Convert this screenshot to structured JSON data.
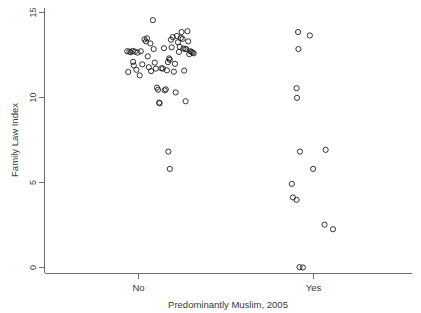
{
  "chart_data": {
    "type": "scatter",
    "title": "",
    "xlabel": "Predominantly Muslim, 2005",
    "ylabel": "Family Law Index",
    "categories": [
      "No",
      "Yes"
    ],
    "yticks": [
      0,
      5,
      10,
      15
    ],
    "ytick_labels": [
      "0",
      "5",
      "10",
      "15"
    ],
    "ylim": [
      -0.6,
      15.2
    ],
    "xlim": [
      0,
      1
    ],
    "grid": false,
    "legend": "none",
    "marker": "open-circle",
    "marker_color": "#1d1d1d",
    "axis_color": "#6e6e6e",
    "note": "Jittered categorical scatter; x positions are jitter offsets within each category band.",
    "series": [
      {
        "name": "No",
        "x_center": 0.295,
        "points": [
          {
            "x": 0.225,
            "y": 12.72
          },
          {
            "x": 0.231,
            "y": 12.7
          },
          {
            "x": 0.235,
            "y": 12.66
          },
          {
            "x": 0.24,
            "y": 12.74
          },
          {
            "x": 0.246,
            "y": 12.7
          },
          {
            "x": 0.253,
            "y": 12.64
          },
          {
            "x": 0.241,
            "y": 12.1
          },
          {
            "x": 0.243,
            "y": 11.88
          },
          {
            "x": 0.228,
            "y": 11.5
          },
          {
            "x": 0.25,
            "y": 11.63
          },
          {
            "x": 0.259,
            "y": 11.3
          },
          {
            "x": 0.262,
            "y": 12.72
          },
          {
            "x": 0.266,
            "y": 11.95
          },
          {
            "x": 0.272,
            "y": 13.42
          },
          {
            "x": 0.276,
            "y": 13.3
          },
          {
            "x": 0.279,
            "y": 13.48
          },
          {
            "x": 0.281,
            "y": 12.42
          },
          {
            "x": 0.284,
            "y": 11.78
          },
          {
            "x": 0.288,
            "y": 13.18
          },
          {
            "x": 0.29,
            "y": 11.55
          },
          {
            "x": 0.295,
            "y": 14.55
          },
          {
            "x": 0.297,
            "y": 12.85
          },
          {
            "x": 0.3,
            "y": 12.05
          },
          {
            "x": 0.303,
            "y": 11.7
          },
          {
            "x": 0.306,
            "y": 10.58
          },
          {
            "x": 0.309,
            "y": 10.46
          },
          {
            "x": 0.312,
            "y": 9.7
          },
          {
            "x": 0.313,
            "y": 9.66
          },
          {
            "x": 0.318,
            "y": 11.72
          },
          {
            "x": 0.322,
            "y": 11.7
          },
          {
            "x": 0.325,
            "y": 12.9
          },
          {
            "x": 0.327,
            "y": 10.42
          },
          {
            "x": 0.33,
            "y": 10.48
          },
          {
            "x": 0.333,
            "y": 11.6
          },
          {
            "x": 0.336,
            "y": 12.08
          },
          {
            "x": 0.339,
            "y": 12.3
          },
          {
            "x": 0.341,
            "y": 12.22
          },
          {
            "x": 0.344,
            "y": 13.4
          },
          {
            "x": 0.346,
            "y": 12.95
          },
          {
            "x": 0.349,
            "y": 13.55
          },
          {
            "x": 0.352,
            "y": 11.52
          },
          {
            "x": 0.355,
            "y": 11.98
          },
          {
            "x": 0.357,
            "y": 10.3
          },
          {
            "x": 0.36,
            "y": 13.62
          },
          {
            "x": 0.363,
            "y": 13.25
          },
          {
            "x": 0.366,
            "y": 12.68
          },
          {
            "x": 0.368,
            "y": 12.98
          },
          {
            "x": 0.371,
            "y": 13.5
          },
          {
            "x": 0.373,
            "y": 13.85
          },
          {
            "x": 0.376,
            "y": 13.45
          },
          {
            "x": 0.378,
            "y": 12.88
          },
          {
            "x": 0.38,
            "y": 11.58
          },
          {
            "x": 0.383,
            "y": 12.86
          },
          {
            "x": 0.386,
            "y": 12.84
          },
          {
            "x": 0.389,
            "y": 13.9
          },
          {
            "x": 0.391,
            "y": 13.3
          },
          {
            "x": 0.394,
            "y": 12.55
          },
          {
            "x": 0.397,
            "y": 12.72
          },
          {
            "x": 0.4,
            "y": 12.68
          },
          {
            "x": 0.403,
            "y": 12.64
          },
          {
            "x": 0.406,
            "y": 12.6
          },
          {
            "x": 0.384,
            "y": 9.78
          },
          {
            "x": 0.337,
            "y": 6.82
          },
          {
            "x": 0.341,
            "y": 5.8
          }
        ]
      },
      {
        "name": "Yes",
        "x_center": 0.745,
        "points": [
          {
            "x": 0.69,
            "y": 13.85
          },
          {
            "x": 0.722,
            "y": 13.65
          },
          {
            "x": 0.691,
            "y": 12.85
          },
          {
            "x": 0.686,
            "y": 10.55
          },
          {
            "x": 0.687,
            "y": 9.98
          },
          {
            "x": 0.695,
            "y": 6.82
          },
          {
            "x": 0.765,
            "y": 6.92
          },
          {
            "x": 0.731,
            "y": 5.8
          },
          {
            "x": 0.673,
            "y": 4.92
          },
          {
            "x": 0.676,
            "y": 4.12
          },
          {
            "x": 0.686,
            "y": 3.98
          },
          {
            "x": 0.762,
            "y": 2.52
          },
          {
            "x": 0.785,
            "y": 2.25
          },
          {
            "x": 0.694,
            "y": 0.02
          },
          {
            "x": 0.703,
            "y": 0.0
          }
        ]
      }
    ]
  },
  "axes": {
    "y_title": "Family Law Index",
    "x_title": "Predominantly Muslim, 2005",
    "category_no": "No",
    "category_yes": "Yes",
    "ytick_0": "0",
    "ytick_5": "5",
    "ytick_10": "10",
    "ytick_15": "15"
  }
}
